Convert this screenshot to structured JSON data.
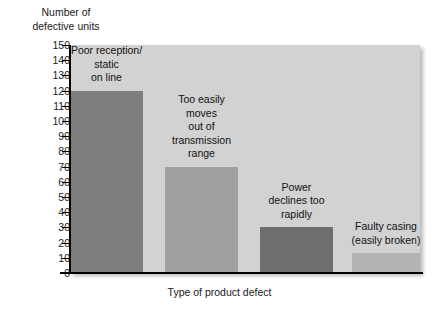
{
  "chart_data": {
    "type": "bar",
    "title": "",
    "xlabel": "Type of product defect",
    "ylabel": "Number of\ndefective units",
    "ylabel_line1": "Number of",
    "ylabel_line2": "defective units",
    "categories": [
      "Poor reception/\nstatic\non line",
      "Too easily\nmoves\nout of\ntransmission\nrange",
      "Power\ndeclines too\nrapidly",
      "Faulty casing\n(easily broken)"
    ],
    "values": [
      120,
      70,
      30,
      13
    ],
    "ylim": [
      0,
      150
    ],
    "ytick_step": 10,
    "yticks": [
      0,
      10,
      20,
      30,
      40,
      50,
      60,
      70,
      80,
      90,
      100,
      110,
      120,
      130,
      140,
      150
    ],
    "ytick_labels": [
      "0",
      "10",
      "20",
      "30",
      "40",
      "50",
      "60",
      "70",
      "80",
      "90",
      "100",
      "110",
      "120",
      "130",
      "140",
      "150"
    ],
    "grid": false,
    "legend": null,
    "plot_background": "#d2d2d2",
    "bar_colors": [
      "#7d7d7d",
      "#a0a0a0",
      "#6e6e6e",
      "#b4b4b4"
    ],
    "bars": [
      {
        "label": "Poor reception/\nstatic\non line",
        "value": 120,
        "color": "#7d7d7d"
      },
      {
        "label": "Too easily\nmoves\nout of\ntransmission\nrange",
        "value": 70,
        "color": "#a0a0a0"
      },
      {
        "label": "Power\ndeclines too\nrapidly",
        "value": 30,
        "color": "#6e6e6e"
      },
      {
        "label": "Faulty casing\n(easily broken)",
        "value": 13,
        "color": "#b4b4b4"
      }
    ]
  }
}
